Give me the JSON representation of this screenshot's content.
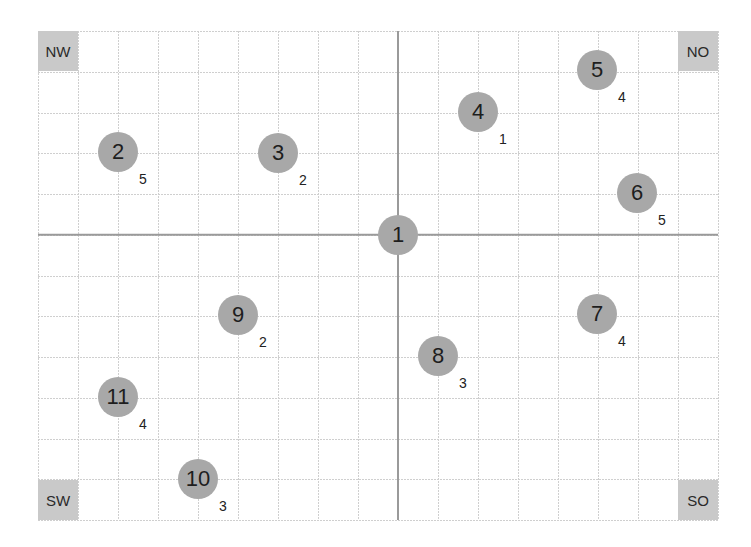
{
  "grid": {
    "left": 38,
    "top": 31,
    "right": 718,
    "bottom": 520,
    "columns": 17,
    "rows": 12,
    "center_column": 9,
    "center_row": 5,
    "grid_color": "#cfcfcf",
    "axis_color": "#9a9a9a"
  },
  "corners": {
    "nw": {
      "label": "NW",
      "x": 38,
      "y": 31
    },
    "no": {
      "label": "NO",
      "x": 678,
      "y": 31
    },
    "sw": {
      "label": "SW",
      "x": 38,
      "y": 480
    },
    "so": {
      "label": "SO",
      "x": 678,
      "y": 480
    }
  },
  "colors": {
    "node_fill": "#a8a8a8",
    "corner_fill": "#c9c9c9",
    "text": "#1e1e1e"
  },
  "nodes": [
    {
      "id": "1",
      "label": "1",
      "sub": "",
      "x": 398,
      "y": 235
    },
    {
      "id": "2",
      "label": "2",
      "sub": "5",
      "x": 118,
      "y": 152
    },
    {
      "id": "3",
      "label": "3",
      "sub": "2",
      "x": 278,
      "y": 153
    },
    {
      "id": "4",
      "label": "4",
      "sub": "1",
      "x": 478,
      "y": 112
    },
    {
      "id": "5",
      "label": "5",
      "sub": "4",
      "x": 597,
      "y": 70
    },
    {
      "id": "6",
      "label": "6",
      "sub": "5",
      "x": 637,
      "y": 193
    },
    {
      "id": "7",
      "label": "7",
      "sub": "4",
      "x": 597,
      "y": 314
    },
    {
      "id": "8",
      "label": "8",
      "sub": "3",
      "x": 438,
      "y": 356
    },
    {
      "id": "9",
      "label": "9",
      "sub": "2",
      "x": 238,
      "y": 315
    },
    {
      "id": "10",
      "label": "10",
      "sub": "3",
      "x": 198,
      "y": 479
    },
    {
      "id": "11",
      "label": "11",
      "sub": "4",
      "x": 118,
      "y": 397
    }
  ]
}
